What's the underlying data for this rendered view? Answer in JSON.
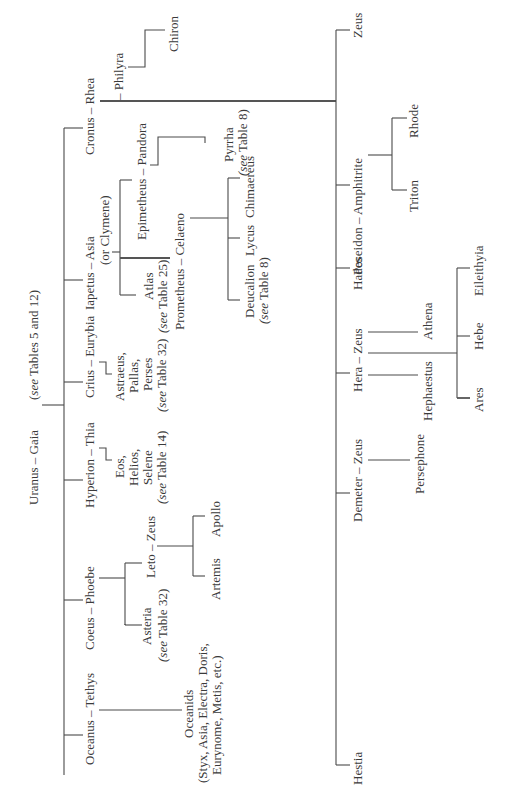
{
  "diagram": {
    "type": "genealogical-tree",
    "orientation": "rotated-90-ccw",
    "root": {
      "label": "Uranus – Gaia",
      "note": "(see Tables 5 and 12)"
    },
    "titan_couples": [
      {
        "label": "Oceanus – Tethys",
        "children": [
          {
            "label": "Oceanids",
            "note": "(Styx, Asia, Electra, Doris,",
            "note2": "Eurynome, Metis, etc.)"
          }
        ]
      },
      {
        "label": "Coeus – Phoebe",
        "children": [
          {
            "label": "Asteria",
            "note": "(see Table 32)"
          },
          {
            "label": "Leto – Zeus",
            "children": [
              {
                "label": "Artemis"
              },
              {
                "label": "Apollo"
              }
            ]
          }
        ]
      },
      {
        "label": "Hyperion – Thia",
        "children": [
          {
            "label": "Eos,",
            "line2": "Helios,",
            "line3": "Selene",
            "note": "(see Table 14)"
          }
        ]
      },
      {
        "label": "Crius – Eurybia",
        "children": [
          {
            "label": "Astraeus,",
            "line2": "Pallas,",
            "line3": "Perses",
            "note": "(see Table 32)"
          }
        ]
      },
      {
        "label": "Iapetus – Asia",
        "note": "(or Clymene)",
        "children": [
          {
            "label": "Atlas",
            "note": "(see Table 25)"
          },
          {
            "label": "Prometheus – Celaeno",
            "children": [
              {
                "label": "Deucalion",
                "note": "(see Table 8)"
              },
              {
                "label": "Lycus"
              },
              {
                "label": "Chimaereus"
              }
            ]
          },
          {
            "label": "Epimetheus – Pandora",
            "children": [
              {
                "label": "Pyrrha",
                "note": "(see Table 8)"
              }
            ]
          }
        ]
      },
      {
        "label": "Cronus – Rhea",
        "children": [
          {
            "label": "Hestia"
          },
          {
            "label": "Demeter – Zeus",
            "children": [
              {
                "label": "Persephone"
              }
            ]
          },
          {
            "label": "Hera – Zeus",
            "children": [
              {
                "label": "Hephaestus"
              },
              {
                "label": "Athena"
              },
              {
                "label": "Ares"
              },
              {
                "label": "Hebe"
              },
              {
                "label": "Eileithyia"
              }
            ]
          },
          {
            "label": "Hades"
          },
          {
            "label": "Poseidon – Amphitrite",
            "children": [
              {
                "label": "Triton"
              },
              {
                "label": "Rhode"
              }
            ]
          },
          {
            "label": "Zeus"
          }
        ]
      },
      {
        "label": "– Philyra",
        "note": "(Cronus – Philyra)",
        "children": [
          {
            "label": "Chiron"
          }
        ]
      }
    ]
  },
  "labels": {
    "root": "Uranus – Gaia",
    "root_note_pre": "(",
    "root_note_see": "see",
    "root_note_post": " Tables 5 and 12)",
    "oceanus": "Oceanus – Tethys",
    "oceanids": "Oceanids",
    "oceanids_note1": "(Styx, Asia, Electra, Doris,",
    "oceanids_note2": "Eurynome, Metis, etc.)",
    "coeus": "Coeus – Phoebe",
    "asteria": "Asteria",
    "asteria_note": " Table 32)",
    "leto": "Leto – Zeus",
    "artemis": "Artemis",
    "apollo": "Apollo",
    "hyperion": "Hyperion – Thia",
    "eos": "Eos,",
    "helios": "Helios,",
    "selene": "Selene",
    "hyperion_note": " Table 14)",
    "crius": "Crius – Eurybia",
    "astraeus": "Astraeus,",
    "pallas": "Pallas,",
    "perses": "Perses",
    "crius_note": " Table 32)",
    "iapetus": "Iapetus – Asia",
    "clymene": "(or Clymene)",
    "atlas": "Atlas",
    "atlas_note": " Table 25)",
    "prometheus": "Prometheus – Celaeno",
    "deucalion": "Deucalion",
    "deucalion_note": " Table 8)",
    "lycus": "Lycus",
    "chimaereus": "Chimaereus",
    "epimetheus": "Epimetheus – Pandora",
    "pyrrha": "Pyrrha",
    "pyrrha_note": " Table 8)",
    "cronus": "Cronus – Rhea",
    "philyra": "– Philyra",
    "chiron": "Chiron",
    "hestia": "Hestia",
    "demeter": "Demeter – Zeus",
    "persephone": "Persephone",
    "hera": "Hera – Zeus",
    "hephaestus": "Hephaestus",
    "athena": "Athena",
    "ares": "Ares",
    "hebe": "Hebe",
    "eileithyia": "Eileithyia",
    "hades": "Hades",
    "poseidon": "Poseidon – Amphitrite",
    "triton": "Triton",
    "rhode": "Rhode",
    "zeus": "Zeus",
    "see": "(see",
    "see_plain": "see"
  }
}
